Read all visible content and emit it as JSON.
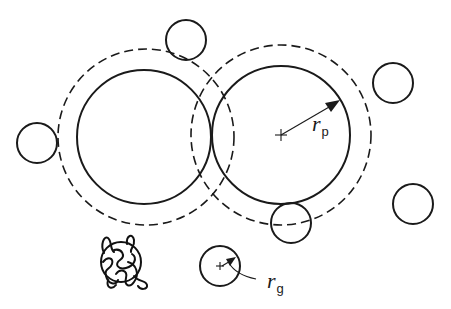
{
  "diagram": {
    "colors": {
      "stroke": "#1a1a1a",
      "background": "#ffffff"
    },
    "large_particles": [
      {
        "id": "left",
        "cx": 144,
        "cy": 137,
        "r": 67,
        "depletion_r": 88
      },
      {
        "id": "right",
        "cx": 281,
        "cy": 135,
        "r": 69,
        "depletion_r": 90
      }
    ],
    "small_particles": [
      {
        "cx": 186,
        "cy": 40,
        "r": 20
      },
      {
        "cx": 37,
        "cy": 143,
        "r": 20
      },
      {
        "cx": 393,
        "cy": 83,
        "r": 20
      },
      {
        "cx": 413,
        "cy": 204,
        "r": 20
      },
      {
        "cx": 291,
        "cy": 223,
        "r": 20
      },
      {
        "cx": 220,
        "cy": 266,
        "r": 20,
        "labeled": true
      }
    ],
    "labels": {
      "rp": {
        "main": "r",
        "sub": "p"
      },
      "rg": {
        "main": "r",
        "sub": "g"
      }
    },
    "icons": {
      "center_marker": "plus-cross",
      "polymer_coil": "tangled-coil"
    }
  }
}
